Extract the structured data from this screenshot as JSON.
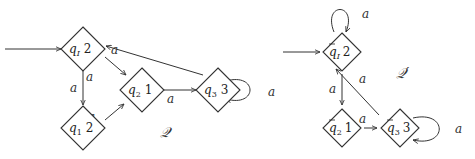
{
  "graphs": [
    {
      "name": "Q",
      "title": "𝒬",
      "title_pos": [
        163,
        134
      ],
      "nodes": [
        {
          "id": "qI",
          "base": "q",
          "sub": "I",
          "bar": false,
          "value": "2",
          "cx": 83,
          "cy": 49,
          "initial": true
        },
        {
          "id": "q1",
          "base": "q",
          "sub": "1",
          "bar": false,
          "value": "2",
          "cx": 83,
          "cy": 128
        },
        {
          "id": "q2",
          "base": "q",
          "sub": "2",
          "bar": false,
          "value": "1",
          "cx": 142,
          "cy": 90
        },
        {
          "id": "q3",
          "base": "q",
          "sub": "3",
          "bar": false,
          "value": "3",
          "cx": 218,
          "cy": 90
        }
      ],
      "edges": [
        {
          "from": "qI",
          "to": "q1",
          "label": "a"
        },
        {
          "from": "qI",
          "to": "q2",
          "label": "a"
        },
        {
          "from": "q1",
          "to": "q2",
          "label": "a"
        },
        {
          "from": "q2",
          "to": "q3",
          "label": "a"
        },
        {
          "from": "q3",
          "to": "qI",
          "label": "a"
        },
        {
          "from": "q3",
          "to": "q3",
          "label": "a",
          "loop": "right"
        }
      ]
    },
    {
      "name": "Q'",
      "title": "𝒬′",
      "title_pos": [
        398,
        75
      ],
      "nodes": [
        {
          "id": "pI",
          "base": "q",
          "sub": "I",
          "bar": true,
          "value": "2",
          "cx": 342,
          "cy": 52,
          "initial": true
        },
        {
          "id": "p2",
          "base": "q",
          "sub": "2",
          "bar": true,
          "value": "1",
          "cx": 342,
          "cy": 128
        },
        {
          "id": "p3",
          "base": "q",
          "sub": "3",
          "bar": true,
          "value": "3",
          "cx": 400,
          "cy": 128
        }
      ],
      "edges": [
        {
          "from": "pI",
          "to": "pI",
          "label": "a",
          "loop": "top"
        },
        {
          "from": "pI",
          "to": "p2",
          "label": "a"
        },
        {
          "from": "p2",
          "to": "p3",
          "label": "a"
        },
        {
          "from": "p3",
          "to": "pI",
          "label": "a"
        },
        {
          "from": "p3",
          "to": "p3",
          "label": "a",
          "loop": "right"
        }
      ]
    }
  ]
}
